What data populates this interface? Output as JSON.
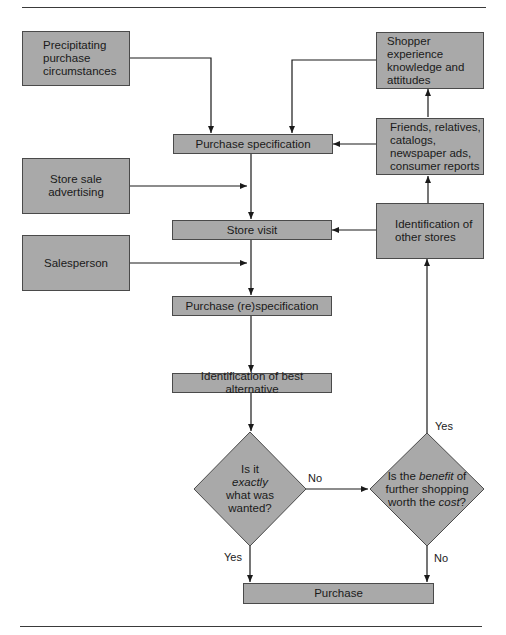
{
  "diagram": {
    "boxes": {
      "precipitating": {
        "lines": [
          "Precipitating",
          "purchase",
          "circumstances"
        ]
      },
      "shopper_experience": {
        "lines": [
          "Shopper experience",
          "knowledge and",
          "attitudes"
        ]
      },
      "friends": {
        "lines": [
          "Friends, relatives,",
          "catalogs,",
          "newspaper ads,",
          "consumer reports"
        ]
      },
      "purchase_specification": {
        "label": "Purchase specification"
      },
      "store_sale_advertising": {
        "lines": [
          "Store sale",
          "advertising"
        ]
      },
      "store_visit": {
        "label": "Store visit"
      },
      "identification_other_stores": {
        "lines": [
          "Identification of",
          "other stores"
        ]
      },
      "salesperson": {
        "label": "Salesperson"
      },
      "purchase_respecification": {
        "label": "Purchase (re)specification"
      },
      "best_alternative": {
        "label": "Identification of best alternative"
      },
      "purchase": {
        "label": "Purchase"
      }
    },
    "decisions": {
      "exactly_wanted": {
        "line1": "Is it",
        "line2_italic": "exactly",
        "line3": "what was",
        "line4": "wanted?"
      },
      "benefit_cost": {
        "line1_pre": "Is the ",
        "line1_italic": "benefit",
        "line1_post": " of",
        "line2": "further shopping",
        "line3_pre": "worth the ",
        "line3_italic": "cost",
        "line3_post": "?"
      }
    },
    "edge_labels": {
      "no_to_benefit": "No",
      "yes_to_purchase": "Yes",
      "yes_to_other_stores": "Yes",
      "no_to_purchase": "No"
    },
    "colors": {
      "box_fill": "#a9a9a9",
      "box_border": "#4a4a4a",
      "line": "#1a1a1a"
    }
  }
}
